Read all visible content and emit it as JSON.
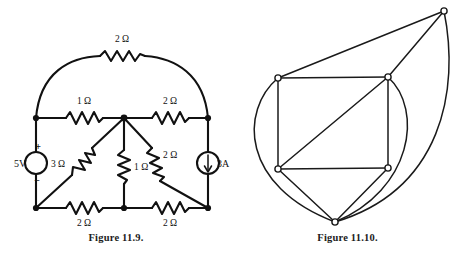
{
  "page": {
    "background": "#ffffff",
    "ink": "#111111",
    "width": 463,
    "height": 258
  },
  "figures": [
    {
      "id": "figure-circuit",
      "caption": "Figure 11.9.",
      "type": "circuit-schematic",
      "sources": [
        {
          "name": "voltage-source",
          "label": "5V",
          "plus": "+",
          "minus": "−"
        },
        {
          "name": "current-source",
          "label": "3A",
          "arrow": "down-arrow-icon"
        }
      ],
      "resistors": [
        {
          "name": "resistor-top-arc",
          "label": "2 Ω"
        },
        {
          "name": "resistor-top-left",
          "label": "1 Ω"
        },
        {
          "name": "resistor-top-right",
          "label": "2 Ω"
        },
        {
          "name": "resistor-diag-left",
          "label": "3 Ω"
        },
        {
          "name": "resistor-center",
          "label": "1 Ω"
        },
        {
          "name": "resistor-diag-right",
          "label": "2 Ω"
        },
        {
          "name": "resistor-bottom-left",
          "label": "2 Ω"
        },
        {
          "name": "resistor-bottom-right",
          "label": "2 Ω"
        }
      ]
    },
    {
      "id": "figure-graph",
      "caption": "Figure 11.10.",
      "type": "linear-graph",
      "node_count": 5,
      "branch_count": 11
    }
  ],
  "captions": {
    "figure_119": "Figure 11.9.",
    "figure_1110": "Figure 11.10."
  },
  "circuit_labels": {
    "top_arc_resistor": "2 Ω",
    "top_left_resistor": "1 Ω",
    "top_right_resistor": "2 Ω",
    "diag_left_resistor": "3 Ω",
    "center_resistor": "1 Ω",
    "diag_right_resistor": "2 Ω",
    "bottom_left_resistor": "2 Ω",
    "bottom_right_resistor": "2 Ω",
    "voltage_source": "5V",
    "voltage_plus": "+",
    "voltage_minus": "−",
    "current_source": "3A"
  }
}
